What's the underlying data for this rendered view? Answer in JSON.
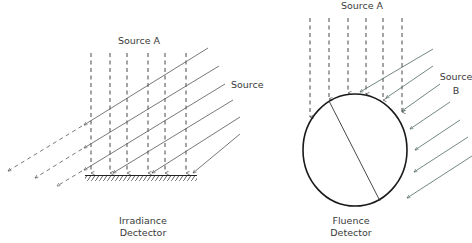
{
  "left_diagram": {
    "source_a_label": "Source A",
    "source_b_label_line1": "Source",
    "source_b_label_line2": "B",
    "detector_label_line1": "Irradiance",
    "detector_label_line2": "Dectector",
    "detector_type": "flat-surface"
  },
  "right_diagram": {
    "source_a_label": "Source A",
    "source_b_label_line1": "Source",
    "source_b_label_line2": "B",
    "detector_label_line1": "Fluence",
    "detector_label_line2": "Detector",
    "detector_type": "sphere"
  },
  "colors": {
    "line": "#333333",
    "source_b_line": "#556b66",
    "detector_outline": "#1a1a1a",
    "text": "#3a3a3a"
  }
}
